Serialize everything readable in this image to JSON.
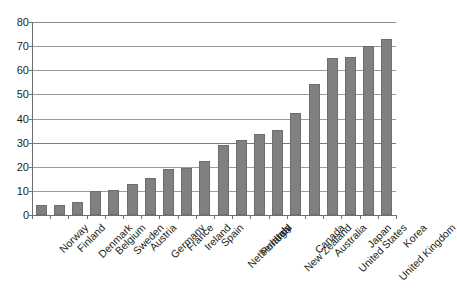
{
  "title_sliver": "..............",
  "colors": {
    "bar_fill": "#808080",
    "bar_stroke": "#6e6e6e",
    "gridline": "#9a9a9a",
    "axis": "#6f6f6f",
    "text": "#231f20",
    "background": "#ffffff"
  },
  "chart_data": {
    "type": "bar",
    "title": "",
    "xlabel": "",
    "ylabel": "",
    "ylim": [
      0,
      80
    ],
    "yticks": [
      0,
      10,
      20,
      30,
      40,
      50,
      60,
      70,
      80
    ],
    "grid": true,
    "legend": "none",
    "orientation": "vertical",
    "categories": [
      "Norway",
      "Finland",
      "Denmark",
      "Belgium",
      "Sweden",
      "Austria",
      "Germany",
      "France",
      "Ireland",
      "Spain",
      "Netherlands",
      "Portugal",
      "Italy",
      "New Zealand",
      "Canada",
      "Australia",
      "United States",
      "Japan",
      "United Kingdom",
      "Korea"
    ],
    "values": [
      4.0,
      4.0,
      5.5,
      10.0,
      10.4,
      13.0,
      15.2,
      19.0,
      19.4,
      22.4,
      29.0,
      31.2,
      33.4,
      35.3,
      42.4,
      54.3,
      65.2,
      65.5,
      70.0,
      73.0
    ]
  }
}
